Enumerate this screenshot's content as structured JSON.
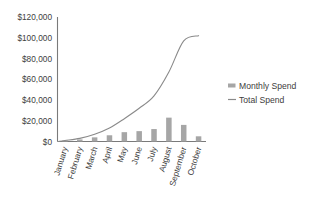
{
  "chart_data": {
    "type": "bar",
    "title": "",
    "xlabel": "",
    "ylabel": "",
    "categories": [
      "January",
      "February",
      "March",
      "April",
      "May",
      "June",
      "July",
      "August",
      "September",
      "October"
    ],
    "series": [
      {
        "name": "Monthly Spend",
        "type": "bar",
        "values": [
          1000,
          2000,
          4000,
          6000,
          9000,
          10000,
          12000,
          23000,
          16000,
          5000
        ]
      },
      {
        "name": "Total Spend",
        "type": "line",
        "values": [
          1000,
          3000,
          7000,
          13000,
          22000,
          32000,
          44000,
          67000,
          97000,
          102000
        ]
      }
    ],
    "ylim": [
      0,
      120000
    ],
    "ytick_labels": [
      "$120,000",
      "$100,000",
      "$80,000",
      "$60,000",
      "$40,000",
      "$20,000",
      "$0"
    ],
    "ytick_values": [
      120000,
      100000,
      80000,
      60000,
      40000,
      20000,
      0
    ],
    "grid": false,
    "legend_position": "right",
    "legend": [
      {
        "label": "Monthly Spend",
        "marker": "square",
        "color": "#a6a6a6"
      },
      {
        "label": "Total Spend",
        "marker": "line",
        "color": "#8a8a8a"
      }
    ],
    "colors": {
      "bar": "#a6a6a6",
      "line": "#8a8a8a",
      "axis": "#7a7a7a",
      "text": "#404040",
      "background": "#ffffff"
    }
  }
}
